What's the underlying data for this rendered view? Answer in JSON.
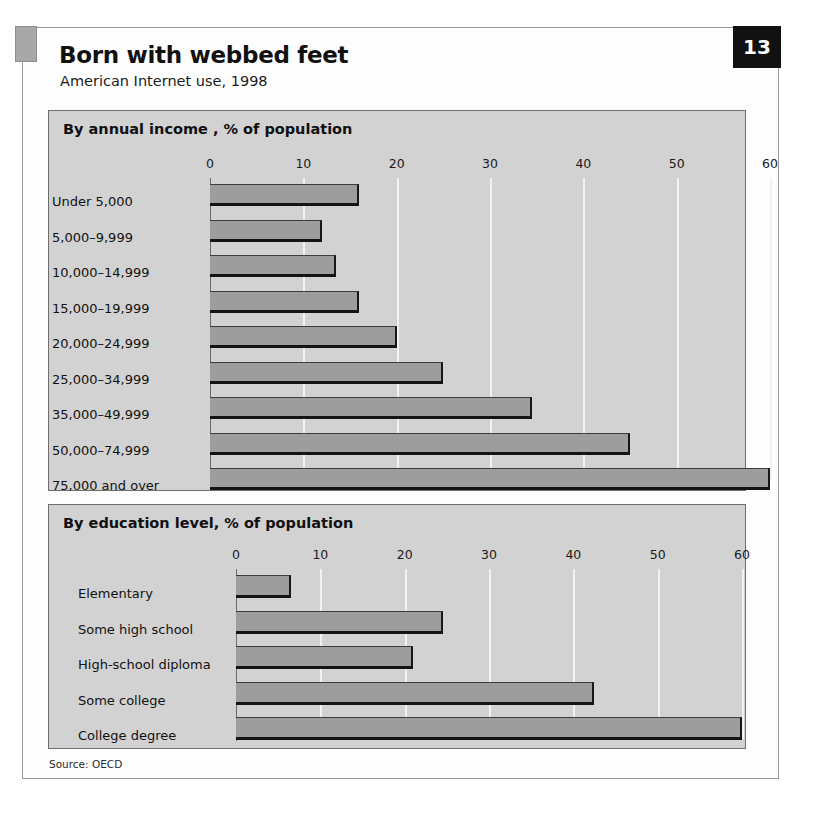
{
  "header": {
    "title": "Born with webbed feet",
    "subtitle": "American Internet use, 1998",
    "page_number": "13"
  },
  "source": "Source: OECD",
  "colors": {
    "bar_fill": "#9d9d9d",
    "bar_edge": "#141414",
    "panel_background": "#d2d2d2",
    "gridline": "#f2f2f2",
    "badge_background": "#111111",
    "page_background": "#ffffff"
  },
  "chart_data": [
    {
      "type": "bar",
      "orientation": "horizontal",
      "title": "By annual income , % of population",
      "xlabel": "",
      "ylabel": "",
      "xlim": [
        0,
        60
      ],
      "ticks": [
        "0",
        "10",
        "20",
        "30",
        "40",
        "50",
        "60"
      ],
      "tick_values": [
        0,
        10,
        20,
        30,
        40,
        50,
        60
      ],
      "grid": true,
      "legend": "none",
      "categories": [
        "Under 5,000",
        "5,000–9,999",
        "10,000–14,999",
        "15,000–19,999",
        "20,000–24,999",
        "25,000–34,999",
        "35,000–49,999",
        "50,000–74,999",
        "75,000 and over"
      ],
      "values": [
        16,
        12,
        13.5,
        16,
        20,
        25,
        34.5,
        45,
        60
      ]
    },
    {
      "type": "bar",
      "orientation": "horizontal",
      "title": "By education level, % of population",
      "xlabel": "",
      "ylabel": "",
      "xlim": [
        0,
        60
      ],
      "ticks": [
        "0",
        "10",
        "20",
        "30",
        "40",
        "50",
        "60"
      ],
      "tick_values": [
        0,
        10,
        20,
        30,
        40,
        50,
        60
      ],
      "grid": true,
      "legend": "none",
      "categories": [
        "Elementary",
        "Some high school",
        "High-school diploma",
        "Some college",
        "College degree"
      ],
      "values": [
        6.5,
        24.5,
        21,
        42.5,
        60
      ]
    }
  ]
}
